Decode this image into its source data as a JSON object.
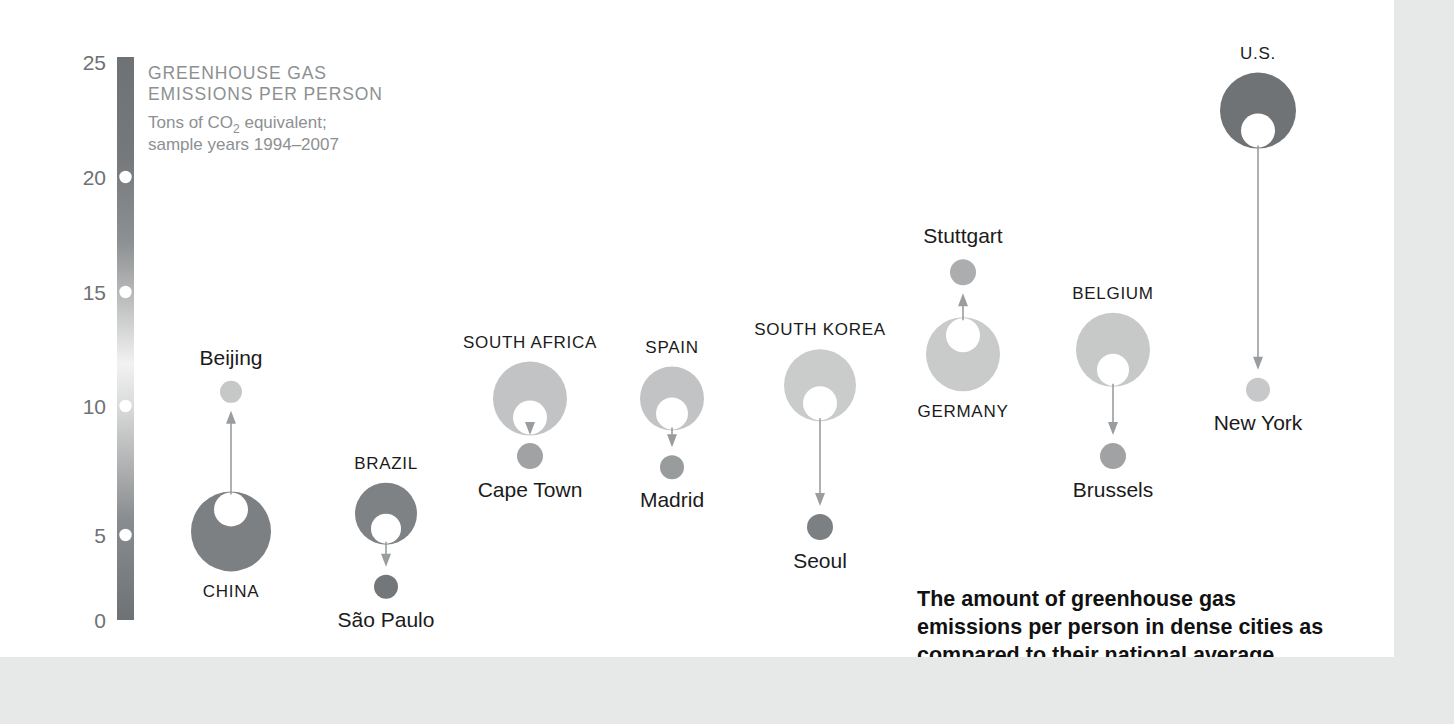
{
  "title": {
    "heading_line1": "GREENHOUSE GAS",
    "heading_line2": "EMISSIONS PER PERSON",
    "subtitle_line1_a": "Tons of CO",
    "subtitle_line1_sub": "2",
    "subtitle_line1_b": " equivalent;",
    "subtitle_line2": "sample years 1994–2007"
  },
  "caption": {
    "line1": "The amount of greenhouse gas",
    "line2": "emissions per person in dense cities as",
    "line3": "compared to their national average"
  },
  "axis": {
    "label": "Tons of CO2 equivalent per person",
    "ticks": [
      "25",
      "20",
      "15",
      "10",
      "5",
      "0"
    ],
    "tick_values": [
      25,
      20,
      15,
      10,
      5,
      0
    ],
    "min": 0,
    "max": 25,
    "gradient_dark": "#6f7275",
    "gradient_light": "#f0f0f0"
  },
  "colors": {
    "ink": "#1b1b1b",
    "muted_text": "#8d9092",
    "axis_text": "#6e7173",
    "page_background": "#e7e8e8",
    "card_background": "#ffffff",
    "connector": "#9a9d9f",
    "hole": "#ffffff"
  },
  "chart_data": {
    "type": "scatter",
    "title": "GREENHOUSE GAS EMISSIONS PER PERSON",
    "subtitle": "Tons of CO2 equivalent; sample years 1994–2007",
    "xlabel": "",
    "ylabel": "Tons of CO2 equivalent",
    "ylim": [
      0,
      25
    ],
    "grid": false,
    "legend": "none",
    "annotation": "The amount of greenhouse gas emissions per person in dense cities as compared to their national average",
    "pairs": [
      {
        "country": "CHINA",
        "country_value": 4.0,
        "country_label_position": "below",
        "city": "Beijing",
        "city_value": 10.3,
        "city_label_position": "above",
        "direction": "up"
      },
      {
        "country": "BRAZIL",
        "country_value": 4.8,
        "country_label_position": "above",
        "city": "São Paulo",
        "city_value": 1.5,
        "city_label_position": "below",
        "direction": "down"
      },
      {
        "country": "SOUTH AFRICA",
        "country_value": 10.0,
        "country_label_position": "above",
        "city": "Cape Town",
        "city_value": 7.4,
        "city_label_position": "below",
        "direction": "down"
      },
      {
        "country": "SPAIN",
        "country_value": 10.0,
        "country_label_position": "above",
        "city": "Madrid",
        "city_value": 6.9,
        "city_label_position": "below",
        "direction": "down"
      },
      {
        "country": "SOUTH KOREA",
        "country_value": 10.6,
        "country_label_position": "above",
        "city": "Seoul",
        "city_value": 4.2,
        "city_label_position": "below",
        "direction": "down"
      },
      {
        "country": "GERMANY",
        "country_value": 12.0,
        "country_label_position": "below",
        "city": "Stuttgart",
        "city_value": 15.7,
        "city_label_position": "above",
        "direction": "up"
      },
      {
        "country": "BELGIUM",
        "country_value": 12.2,
        "country_label_position": "above",
        "city": "Brussels",
        "city_value": 7.4,
        "city_label_position": "below",
        "direction": "down"
      },
      {
        "country": "U.S.",
        "country_value": 23.0,
        "country_label_position": "above",
        "city": "New York",
        "city_value": 10.4,
        "city_label_position": "below",
        "direction": "down"
      }
    ]
  }
}
